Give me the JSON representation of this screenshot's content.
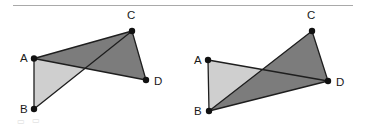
{
  "canvas": {
    "width": 367,
    "height": 131,
    "background": "#ffffff"
  },
  "rule": {
    "name": "horizontal-rule",
    "x1": 13,
    "x2": 353,
    "y": 5.5,
    "color": "#a9a9a9",
    "thickness": 1.2
  },
  "style": {
    "dark_fill": "#7c7c7c",
    "light_fill": "#cfcfcf",
    "stroke": "#1e1e1e",
    "stroke_width": 1.3,
    "dot_color": "#111111",
    "dot_radius": 3.2,
    "label_color": "#1a1a1a"
  },
  "figures": [
    {
      "id": "figure-left",
      "name": "quadrilateral-crossed-left",
      "points": {
        "A": {
          "x": 34,
          "y": 58.5
        },
        "B": {
          "x": 34,
          "y": 109
        },
        "C": {
          "x": 132,
          "y": 31
        },
        "D": {
          "x": 146,
          "y": 80
        }
      },
      "labels": [
        {
          "key": "A",
          "text": "A",
          "x": 20,
          "y": 62
        },
        {
          "key": "B",
          "text": "B",
          "x": 20,
          "y": 113
        },
        {
          "key": "C",
          "text": "C",
          "x": 127,
          "y": 19
        },
        {
          "key": "D",
          "text": "D",
          "x": 154,
          "y": 85
        }
      ],
      "triangles": [
        {
          "name": "triangle-abc-light",
          "vertices": [
            "A",
            "B",
            "C"
          ],
          "shade": "light"
        },
        {
          "name": "triangle-acd-dark",
          "vertices": [
            "A",
            "C",
            "D"
          ],
          "shade": "dark"
        }
      ],
      "edges": [
        {
          "name": "edge-ab",
          "from": "A",
          "to": "B"
        },
        {
          "name": "edge-ac",
          "from": "A",
          "to": "C"
        },
        {
          "name": "edge-ad",
          "from": "A",
          "to": "D"
        },
        {
          "name": "edge-bc",
          "from": "B",
          "to": "C"
        },
        {
          "name": "edge-cd",
          "from": "C",
          "to": "D"
        }
      ]
    },
    {
      "id": "figure-right",
      "name": "quadrilateral-crossed-right",
      "points": {
        "A": {
          "x": 208,
          "y": 60
        },
        "B": {
          "x": 209,
          "y": 111
        },
        "C": {
          "x": 312,
          "y": 31
        },
        "D": {
          "x": 328,
          "y": 81
        }
      },
      "labels": [
        {
          "key": "A",
          "text": "A",
          "x": 194,
          "y": 64
        },
        {
          "key": "B",
          "text": "B",
          "x": 194,
          "y": 115
        },
        {
          "key": "C",
          "text": "C",
          "x": 307,
          "y": 19
        },
        {
          "key": "D",
          "text": "D",
          "x": 336,
          "y": 86
        }
      ],
      "triangles": [
        {
          "name": "triangle-abd-light",
          "vertices": [
            "A",
            "B",
            "D"
          ],
          "shade": "light"
        },
        {
          "name": "triangle-bcd-dark",
          "vertices": [
            "B",
            "C",
            "D"
          ],
          "shade": "dark"
        }
      ],
      "edges": [
        {
          "name": "edge-ab",
          "from": "A",
          "to": "B"
        },
        {
          "name": "edge-ad",
          "from": "A",
          "to": "D"
        },
        {
          "name": "edge-bc",
          "from": "B",
          "to": "C"
        },
        {
          "name": "edge-bd",
          "from": "B",
          "to": "D"
        },
        {
          "name": "edge-cd",
          "from": "C",
          "to": "D"
        }
      ]
    }
  ],
  "artifacts": [
    {
      "name": "faint-margin-mark",
      "x": 17,
      "y": 124,
      "text": "▭"
    },
    {
      "name": "faint-margin-mark-2",
      "x": 32,
      "y": 123,
      "text": "▭"
    }
  ]
}
